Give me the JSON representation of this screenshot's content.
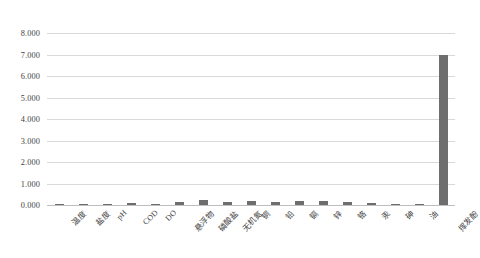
{
  "chart_data": {
    "type": "bar",
    "title": "",
    "subtitle": "",
    "xlabel": "",
    "ylabel": "",
    "ylim": [
      0,
      8
    ],
    "grid": true,
    "legend": null,
    "bar_color": "#6e6e6e",
    "gridline_color": "#d9d9d9",
    "y_ticks": [
      "0.000",
      "1.000",
      "2.000",
      "3.000",
      "4.000",
      "5.000",
      "6.000",
      "7.000",
      "8.000"
    ],
    "y_tick_values": [
      0,
      1,
      2,
      3,
      4,
      5,
      6,
      7,
      8
    ],
    "categories": [
      "温度",
      "盐度",
      "pH",
      "COD",
      "DO",
      "悬浮物",
      "磷酸盐",
      "无机氮",
      "铜",
      "铅",
      "镉",
      "锌",
      "铬",
      "汞",
      "砷",
      "油",
      "挥发酚"
    ],
    "values": [
      0.01,
      0.04,
      0.015,
      0.11,
      0.04,
      0.16,
      0.23,
      0.13,
      0.18,
      0.13,
      0.17,
      0.17,
      0.15,
      0.11,
      0.04,
      0.01,
      7.0
    ]
  }
}
